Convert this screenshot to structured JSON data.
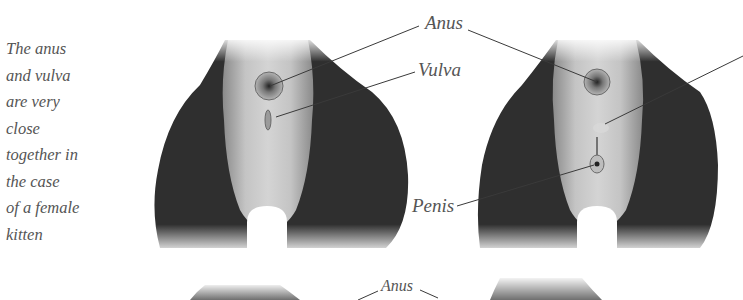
{
  "caption": {
    "lines": [
      "The anus",
      "and vulva",
      "are very",
      "close",
      "together in",
      "the case",
      "of a female",
      "kitten"
    ]
  },
  "labels": {
    "female_anus": "Anus",
    "female_vulva": "Vulva",
    "male_penis": "Penis",
    "bottom_anus": "Anus"
  },
  "colors": {
    "fur_dark": "#2e2e2e",
    "fur_light": "#c9c9c9",
    "label_text": "#555555",
    "leader_line": "#3a3a3a"
  }
}
